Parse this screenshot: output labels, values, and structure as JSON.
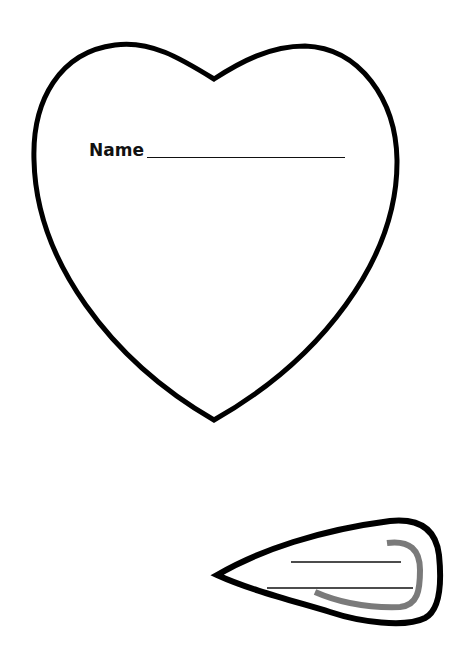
{
  "worksheet": {
    "heart": {
      "label": "Name",
      "outline_color": "#000000",
      "path": "M 214 79 C 180 58, 150 40, 115 45 C 60 52, 32 100, 34 160 C 36 260, 110 360, 214 420 C 320 360, 398 260, 397 160 C 396 100, 360 48, 305 46 C 270 46, 240 62, 214 79 Z"
    },
    "teardrop": {
      "outline_color": "#000000",
      "hook_color": "#7a7a7a",
      "path": "M 217 575 C 260 550, 320 530, 390 521 C 420 518, 436 530, 439 555 C 442 585, 440 610, 425 618 C 405 628, 360 622, 330 612 C 290 600, 250 590, 217 575 Z",
      "hook_path": "M 387 543 C 410 540, 420 550, 420 570 C 420 590, 418 605, 400 607 C 370 608, 340 603, 315 592",
      "lines": [
        {
          "x1": 291,
          "y1": 562,
          "x2": 401,
          "y2": 562
        },
        {
          "x1": 267,
          "y1": 588,
          "x2": 413,
          "y2": 588
        }
      ]
    }
  }
}
